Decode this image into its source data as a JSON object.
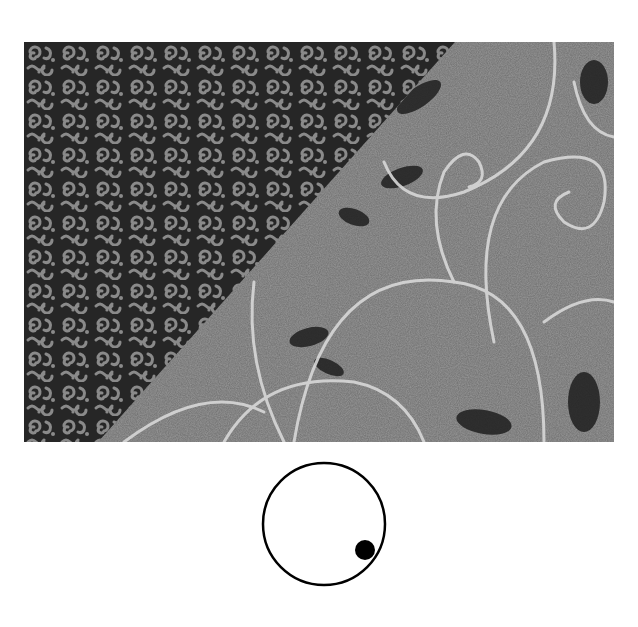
{
  "figure": {
    "photo": {
      "description": "Two fabrics overlapping along a diagonal: small dark scroll print (left) and larger gray print with light swirling vines and dark leaves (right)",
      "left_fabric": "small-scroll-print",
      "right_fabric": "large-vine-leaf-print",
      "colors": {
        "dark_fabric": "#262626",
        "dark_motif": "#8a8a8a",
        "light_fabric": "#6e6e6e",
        "vine": "#d8d8d8",
        "leaf": "#1e1e1e"
      }
    },
    "diagram": {
      "shape": "circle",
      "marker": "filled-dot",
      "marker_position": "lower-right",
      "colors": {
        "stroke": "#000000",
        "fill": "#ffffff",
        "dot": "#000000"
      }
    }
  }
}
